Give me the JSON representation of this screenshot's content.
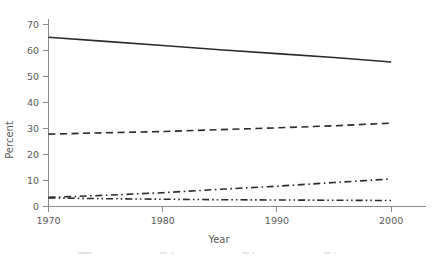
{
  "chart_data": {
    "type": "line",
    "title": "",
    "xlabel": "Year",
    "ylabel": "Percent",
    "xlim": [
      1970,
      2002
    ],
    "ylim": [
      0,
      72
    ],
    "grid": false,
    "legend_position": "bottom",
    "x": [
      1970,
      1975,
      1980,
      1985,
      1990,
      1995,
      2000
    ],
    "xticks": [
      1970,
      1980,
      1990,
      2000
    ],
    "xtick_labels": [
      "1970",
      "1980",
      "1990",
      "2000"
    ],
    "yticks": [
      0,
      10,
      20,
      30,
      40,
      50,
      60,
      70
    ],
    "ytick_labels": [
      "0",
      "10",
      "20",
      "30",
      "40",
      "50",
      "60",
      "70"
    ],
    "series": [
      {
        "name": "series-1",
        "style": "solid",
        "values": [
          65.0,
          63.4,
          61.8,
          60.2,
          58.7,
          57.2,
          55.5
        ]
      },
      {
        "name": "series-2",
        "style": "dashed",
        "values": [
          27.8,
          28.3,
          28.8,
          29.5,
          30.2,
          31.0,
          32.0
        ]
      },
      {
        "name": "series-3",
        "style": "dash-dot",
        "values": [
          3.5,
          4.3,
          5.3,
          6.6,
          7.8,
          9.2,
          10.6
        ]
      },
      {
        "name": "series-4",
        "style": "dash-dot-dot",
        "values": [
          3.3,
          3.0,
          2.8,
          2.6,
          2.5,
          2.4,
          2.3
        ]
      }
    ]
  },
  "legend": {
    "cut_off": true,
    "items": [
      {
        "label": "",
        "style": "solid"
      },
      {
        "label": "",
        "style": "dashed"
      },
      {
        "label": "",
        "style": "dash-dot"
      },
      {
        "label": "",
        "style": "dash-dot-dot"
      }
    ]
  }
}
